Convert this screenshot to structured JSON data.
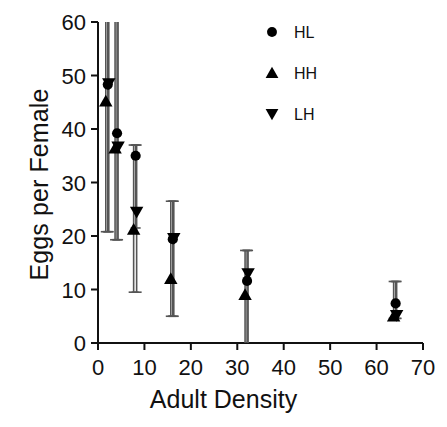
{
  "chart_data": {
    "type": "scatter",
    "title": "",
    "xlabel": "Adult Density",
    "ylabel": "Eggs per Female",
    "xlim": [
      0,
      70
    ],
    "ylim": [
      0,
      60
    ],
    "xticks": [
      0,
      10,
      20,
      30,
      40,
      50,
      60,
      70
    ],
    "yticks": [
      0,
      10,
      20,
      30,
      40,
      50,
      60
    ],
    "grid": false,
    "legend_position": "top-right",
    "error_bars": "vertical",
    "categories": [
      2,
      4,
      8,
      16,
      32,
      64
    ],
    "series": [
      {
        "name": "HL",
        "marker": "circle",
        "color": "#000000",
        "x": [
          2,
          4,
          8,
          16,
          32,
          64
        ],
        "values": [
          48.3,
          39.2,
          35.0,
          19.4,
          11.6,
          7.4
        ],
        "err_low": [
          20.8,
          19.3,
          21.5,
          5.0,
          0.0,
          4.6
        ],
        "err_high": [
          60.0,
          60.0,
          37.0,
          26.5,
          17.3,
          11.5
        ]
      },
      {
        "name": "HH",
        "marker": "triangle-up",
        "color": "#000000",
        "x": [
          2,
          4,
          8,
          16,
          32,
          64
        ],
        "values": [
          45.2,
          36.4,
          21.2,
          12.0,
          9.0,
          5.0
        ],
        "err_low": [
          20.8,
          19.3,
          9.5,
          5.0,
          0.0,
          4.6
        ],
        "err_high": [
          60.0,
          60.0,
          37.0,
          26.5,
          17.3,
          11.5
        ]
      },
      {
        "name": "LH",
        "marker": "triangle-down",
        "color": "#000000",
        "x": [
          2,
          4,
          8,
          16,
          32,
          64
        ],
        "values": [
          48.5,
          36.7,
          24.5,
          19.6,
          13.0,
          5.2
        ],
        "err_low": [
          20.8,
          19.3,
          9.5,
          5.0,
          0.0,
          4.6
        ],
        "err_high": [
          60.0,
          60.0,
          37.0,
          26.5,
          17.3,
          11.5
        ]
      }
    ],
    "legend": [
      {
        "label": "HL",
        "marker": "circle"
      },
      {
        "label": "HH",
        "marker": "triangle-up"
      },
      {
        "label": "LH",
        "marker": "triangle-down"
      }
    ]
  }
}
